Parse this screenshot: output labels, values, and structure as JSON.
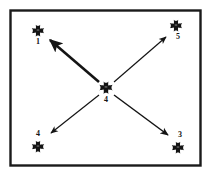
{
  "figure": {
    "type": "node-arrow-diagram",
    "border": {
      "color": "#1a1a1a",
      "style": "solid rectangle"
    },
    "background_color": "#ffffff",
    "ink_color": "#141414"
  },
  "nodes": [
    {
      "id": "node-1",
      "label": "1",
      "icon": "cross-pattee-icon",
      "position": "top-left",
      "label_position": "below",
      "x": 38,
      "y": 31
    },
    {
      "id": "node-5",
      "label": "5",
      "icon": "cross-pattee-icon",
      "position": "top-right",
      "label_position": "below",
      "x": 176,
      "y": 26
    },
    {
      "id": "node-4-center",
      "label": "4",
      "icon": "cross-pattee-icon",
      "position": "center",
      "label_position": "below",
      "x": 106,
      "y": 88
    },
    {
      "id": "node-4-bottom-left",
      "label": "4",
      "icon": "cross-pattee-icon",
      "position": "bottom-left",
      "label_position": "above",
      "x": 38,
      "y": 147
    },
    {
      "id": "node-3",
      "label": "3",
      "icon": "cross-pattee-icon",
      "position": "bottom-right",
      "label_position": "above",
      "x": 178,
      "y": 148
    }
  ],
  "arrows": [
    {
      "id": "arrow-center-to-top-left",
      "from": "node-4-center",
      "to": "node-1",
      "stroke_width": 2.6,
      "weight": "thick",
      "arrowhead": "at-target"
    },
    {
      "id": "arrow-center-to-top-right",
      "from": "node-4-center",
      "to": "node-5",
      "stroke_width": 1.2,
      "weight": "thin",
      "arrowhead": "at-target"
    },
    {
      "id": "arrow-center-to-bottom-left",
      "from": "node-4-center",
      "to": "node-4-bottom-left",
      "stroke_width": 1.2,
      "weight": "thin",
      "arrowhead": "at-target"
    },
    {
      "id": "arrow-center-to-bottom-right",
      "from": "node-4-center",
      "to": "node-3",
      "stroke_width": 1.5,
      "weight": "thin",
      "arrowhead": "at-target"
    }
  ]
}
